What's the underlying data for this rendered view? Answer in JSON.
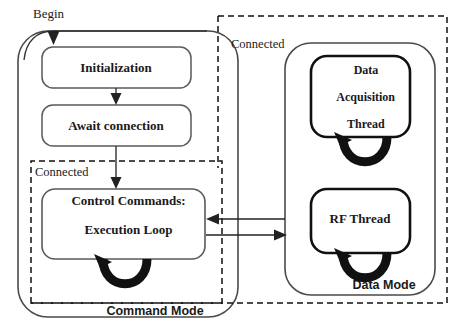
{
  "diagram": {
    "colors": {
      "stroke": "#3a3a3a",
      "thick_stroke": "#111111",
      "dashed_stroke": "#111111",
      "text": "#1a1a1a",
      "background": "#ffffff"
    },
    "entry_label": "Begin",
    "regions": [
      {
        "id": "command-mode",
        "mode_label": "Command Mode",
        "connected_label": "Connected"
      },
      {
        "id": "data-mode",
        "mode_label": "Data Mode",
        "connected_label": "Connected"
      }
    ],
    "nodes": [
      {
        "id": "initialization",
        "label": "Initialization",
        "lines": [
          "Initialization"
        ]
      },
      {
        "id": "await-connection",
        "label": "Await connection",
        "lines": [
          "Await connection"
        ]
      },
      {
        "id": "control-commands",
        "label": "Control Commands: Execution Loop",
        "lines": [
          "Control Commands:",
          "Execution Loop"
        ]
      },
      {
        "id": "data-acquisition-thread",
        "label": "Data Acquisition Thread",
        "lines": [
          "Data",
          "Acquisition",
          "Thread"
        ]
      },
      {
        "id": "rf-thread",
        "label": "RF Thread",
        "lines": [
          "RF Thread"
        ]
      }
    ],
    "edges": [
      {
        "id": "begin-to-initialization",
        "from": "Begin",
        "to": "Initialization",
        "style": "curved-arrow"
      },
      {
        "id": "initialization-to-await",
        "from": "Initialization",
        "to": "Await connection",
        "style": "arrow"
      },
      {
        "id": "await-to-control",
        "from": "Await connection",
        "to": "Control Commands: Execution Loop",
        "style": "arrow"
      },
      {
        "id": "data-to-control",
        "from": "Data Mode",
        "to": "Control Commands: Execution Loop",
        "style": "arrow-left"
      },
      {
        "id": "control-to-data",
        "from": "Control Commands: Execution Loop",
        "to": "Data Mode",
        "style": "arrow-right"
      },
      {
        "id": "control-self-loop",
        "from": "Control Commands: Execution Loop",
        "to": "Control Commands: Execution Loop",
        "style": "self-loop"
      },
      {
        "id": "acquisition-self-loop",
        "from": "Data Acquisition Thread",
        "to": "Data Acquisition Thread",
        "style": "self-loop"
      },
      {
        "id": "rf-self-loop",
        "from": "RF Thread",
        "to": "RF Thread",
        "style": "self-loop"
      }
    ]
  }
}
